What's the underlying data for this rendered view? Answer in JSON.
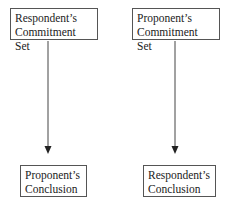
{
  "diagram": {
    "left": {
      "top_box": {
        "line1": "Respondent’s",
        "line2": "Commitment Set"
      },
      "bottom_box": {
        "line1": "Proponent’s",
        "line2": "Conclusion"
      }
    },
    "right": {
      "top_box": {
        "line1": "Proponent’s",
        "line2": "Commitment Set"
      },
      "bottom_box": {
        "line1": "Respondent’s",
        "line2": "Conclusion"
      }
    },
    "line_color": "#444444"
  }
}
